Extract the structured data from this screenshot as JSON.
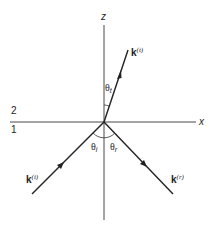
{
  "diagram": {
    "axes": {
      "z_label": "z",
      "x_label": "x"
    },
    "media": {
      "upper": "2",
      "lower": "1"
    },
    "vectors": {
      "transmitted": {
        "symbol": "k",
        "superscript": "(t)"
      },
      "incident": {
        "symbol": "k",
        "superscript": "(i)"
      },
      "reflected": {
        "symbol": "k",
        "superscript": "(r)"
      }
    },
    "angles": {
      "transmitted": {
        "symbol": "θ",
        "subscript": "t"
      },
      "incident": {
        "symbol": "θ",
        "subscript": "i"
      },
      "reflected": {
        "symbol": "θ",
        "subscript": "r"
      }
    },
    "colors": {
      "line": "#222222",
      "background": "#ffffff"
    }
  }
}
